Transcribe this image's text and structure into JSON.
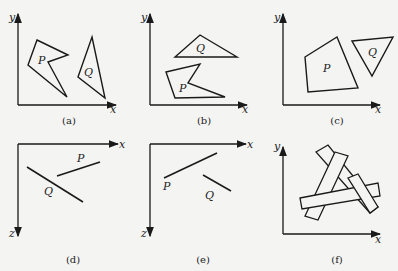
{
  "figure": {
    "panels": [
      {
        "id": "a",
        "caption": "(a)",
        "axes": {
          "vertical": "y",
          "horizontal": "x"
        },
        "labels": {
          "P": "P",
          "Q": "Q"
        }
      },
      {
        "id": "b",
        "caption": "(b)",
        "axes": {
          "vertical": "y",
          "horizontal": "x"
        },
        "labels": {
          "P": "P",
          "Q": "Q"
        }
      },
      {
        "id": "c",
        "caption": "(c)",
        "axes": {
          "vertical": "y",
          "horizontal": "x"
        },
        "labels": {
          "P": "P",
          "Q": "Q"
        }
      },
      {
        "id": "d",
        "caption": "(d)",
        "axes": {
          "vertical": "z",
          "horizontal": "x"
        },
        "labels": {
          "P": "P",
          "Q": "Q"
        }
      },
      {
        "id": "e",
        "caption": "(e)",
        "axes": {
          "vertical": "z",
          "horizontal": "x"
        },
        "labels": {
          "P": "P",
          "Q": "Q"
        }
      },
      {
        "id": "f",
        "caption": "(f)",
        "axes": {
          "vertical": "y",
          "horizontal": "x"
        },
        "labels": {}
      }
    ]
  }
}
